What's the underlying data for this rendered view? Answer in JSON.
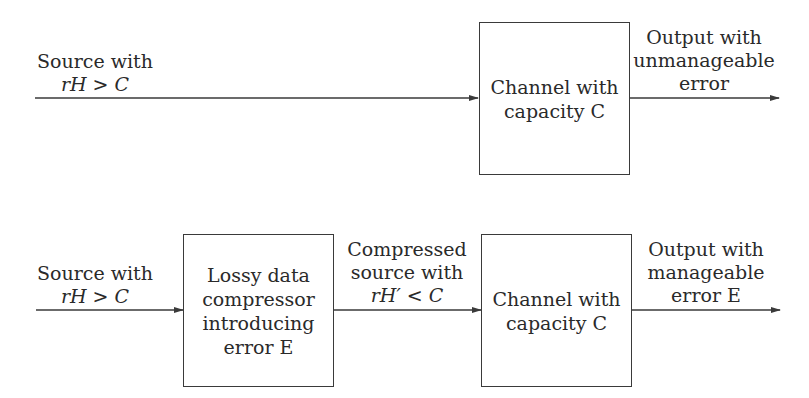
{
  "diagram": {
    "top_row": {
      "input_label": [
        "Source with",
        "rH > C"
      ],
      "channel_box": [
        "Channel with",
        "capacity C"
      ],
      "output_label": [
        "Output with",
        "unmanageable",
        "error"
      ]
    },
    "bottom_row": {
      "input_label": [
        "Source with",
        "rH > C"
      ],
      "compressor_box": [
        "Lossy data",
        "compressor",
        "introducing",
        "error E"
      ],
      "middle_label": [
        "Compressed",
        "source with",
        "rH′ < C"
      ],
      "channel_box": [
        "Channel with",
        "capacity C"
      ],
      "output_label": [
        "Output with",
        "manageable",
        "error E"
      ]
    },
    "colors": {
      "line": "#3a3a3a",
      "text": "#2a2a2a",
      "background": "#ffffff"
    }
  }
}
